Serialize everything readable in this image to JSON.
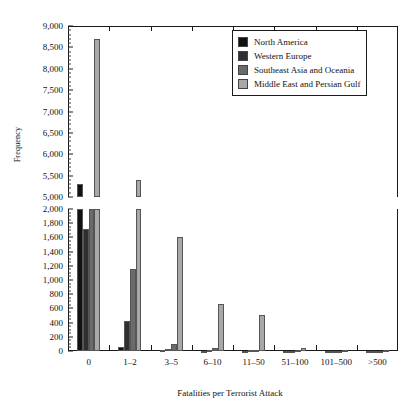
{
  "chart_data": {
    "type": "bar",
    "title": "",
    "xlabel": "Fatalities per Terrorist Attack",
    "ylabel": "Frequency",
    "grid": false,
    "legend_position": "top-right",
    "broken_axis": true,
    "axis_lower": {
      "min": 0,
      "max": 2000,
      "tick_step": 200,
      "minor_step": 50
    },
    "axis_upper": {
      "min": 5000,
      "max": 9000,
      "tick_step": 500,
      "minor_step": 100
    },
    "ylim": [
      0,
      9000
    ],
    "categories": [
      "0",
      "1–2",
      "3–5",
      "6–10",
      "11–50",
      "51–100",
      "101–500",
      ">500"
    ],
    "series": [
      {
        "name": "North America",
        "color": "#111111",
        "values": [
          5300,
          60,
          10,
          5,
          5,
          3,
          1,
          1
        ]
      },
      {
        "name": "Western Europe",
        "color": "#2f2f2f",
        "values": [
          1720,
          425,
          30,
          10,
          8,
          4,
          2,
          1
        ]
      },
      {
        "name": "Southeast Asia and Oceania",
        "color": "#6b6b6b",
        "values": [
          2000,
          1160,
          105,
          40,
          20,
          8,
          4,
          2
        ]
      },
      {
        "name": "Middle East and Persian Gulf",
        "color": "#a8a8a8",
        "values": [
          8700,
          5400,
          1610,
          665,
          510,
          45,
          20,
          10
        ]
      }
    ],
    "ytick_labels_upper": [
      "9,000",
      "8,500",
      "8,000",
      "7,500",
      "7,000",
      "6,500",
      "6,000",
      "5,500",
      "5,000"
    ],
    "ytick_labels_lower": [
      "2,000",
      "1,800",
      "1,600",
      "1,400",
      "1,200",
      "1,000",
      "800",
      "600",
      "400",
      "200",
      "0"
    ]
  },
  "legend": {
    "items": [
      {
        "label": "North America"
      },
      {
        "label": "Western Europe"
      },
      {
        "label": "Southeast Asia and Oceania"
      },
      {
        "label": "Middle East and Persian Gulf"
      }
    ]
  }
}
